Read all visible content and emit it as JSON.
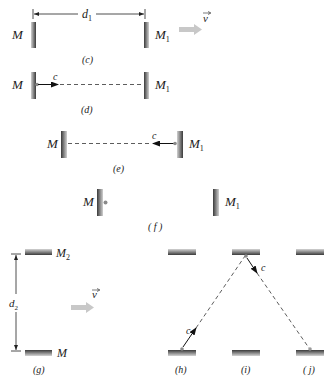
{
  "figure": {
    "panels": {
      "c": {
        "caption": "(c)",
        "mirror_left_label": "M",
        "mirror_right_label": "M",
        "mirror_right_sub": "1",
        "distance_label": "d",
        "distance_sub": "1",
        "velocity_label": "v"
      },
      "d": {
        "caption": "(d)",
        "mirror_left_label": "M",
        "mirror_right_label": "M",
        "mirror_right_sub": "1",
        "light_label": "c"
      },
      "e": {
        "caption": "(e)",
        "mirror_left_label": "M",
        "mirror_right_label": "M",
        "mirror_right_sub": "1",
        "light_label": "c"
      },
      "f": {
        "caption": "( f )",
        "mirror_left_label": "M",
        "mirror_right_label": "M",
        "mirror_right_sub": "1"
      },
      "g": {
        "caption": "(g)",
        "mirror_top_label": "M",
        "mirror_top_sub": "2",
        "mirror_bottom_label": "M",
        "distance_label": "d",
        "distance_sub": "2",
        "velocity_label": "v"
      },
      "h": {
        "caption": "(h)",
        "light_label": "c"
      },
      "i": {
        "caption": "(i)",
        "light_label": "c"
      },
      "j": {
        "caption": "( j)"
      }
    },
    "colors": {
      "mirror_dark": "#3a3a3a",
      "mirror_light": "#d8d8d8",
      "velocity_arrow": "#c8c8c8",
      "line": "#222222",
      "dot": "#8a8a8a"
    }
  }
}
